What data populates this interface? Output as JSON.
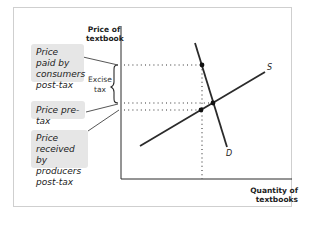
{
  "diagram": {
    "type": "supply-demand-excise-tax",
    "y_axis_label": "Price of textbook",
    "y_axis_label_lines": [
      "Price of",
      "textbook"
    ],
    "x_axis_label": "Quantity of textbooks",
    "curves": {
      "supply": "S",
      "demand": "D"
    },
    "brace_label": "Excise tax",
    "brace_label_lines": [
      "Excise",
      "tax"
    ],
    "callouts": [
      {
        "id": "consumers",
        "text": "Price paid by consumers post-tax",
        "lines": [
          "Price paid by",
          "consumers",
          "post-tax"
        ]
      },
      {
        "id": "pretax",
        "text": "Price pre-tax",
        "lines": [
          "Price pre-tax"
        ]
      },
      {
        "id": "producers",
        "text": "Price received by producers post-tax",
        "lines": [
          "Price received",
          "by producers",
          "post-tax"
        ]
      }
    ],
    "colors": {
      "line": "#2b2b2b",
      "callout_bg": "#e6e6e6",
      "frame": "#cfcfcf"
    }
  }
}
